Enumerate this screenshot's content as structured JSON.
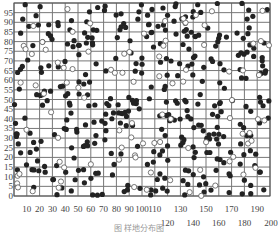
{
  "chart_data": {
    "type": "scatter",
    "title": "",
    "xlabel": "",
    "ylabel": "",
    "xlim": [
      0,
      200
    ],
    "ylim": [
      0,
      100
    ],
    "grid": true,
    "x_ticks": [
      10,
      20,
      30,
      40,
      50,
      60,
      70,
      80,
      90,
      100,
      110,
      120,
      130,
      140,
      150,
      160,
      170,
      180,
      190,
      200
    ],
    "y_ticks": [
      0,
      5,
      10,
      15,
      20,
      25,
      30,
      35,
      40,
      45,
      50,
      55,
      60,
      65,
      70,
      75,
      80,
      85,
      90,
      95
    ],
    "series": [
      {
        "name": "filled",
        "marker": "filled-circle",
        "color": "#222222",
        "count_approx": 600
      },
      {
        "name": "open",
        "marker": "open-circle",
        "color": "#555555",
        "count_approx": 150
      }
    ]
  },
  "caption": "图    样地分布图"
}
